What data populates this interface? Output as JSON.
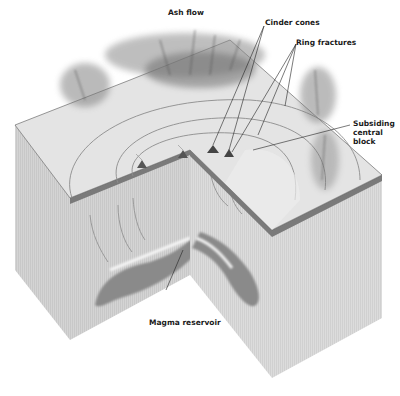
{
  "diagram": {
    "type": "cutaway block diagram",
    "colors": {
      "background": "#ffffff",
      "top_surface": "#e2e2e2",
      "block_side_left": "#cfcfcf",
      "block_side_right": "#d8d8d8",
      "crust_band": "#7a7a7a",
      "magma": "#8a8a8a",
      "ash_plume": "#6e6e6e",
      "fracture_line": "#8c8c8c",
      "leader_line": "#222222"
    },
    "labels": {
      "ash_flow": "Ash flow",
      "cinder_cones": "Cinder cones",
      "ring_fractures": "Ring fractures",
      "subsiding_central_block_line1": "Subsiding",
      "subsiding_central_block_line2": "central",
      "subsiding_central_block_line3": "block",
      "magma_reservoir": "Magma reservoir"
    }
  }
}
